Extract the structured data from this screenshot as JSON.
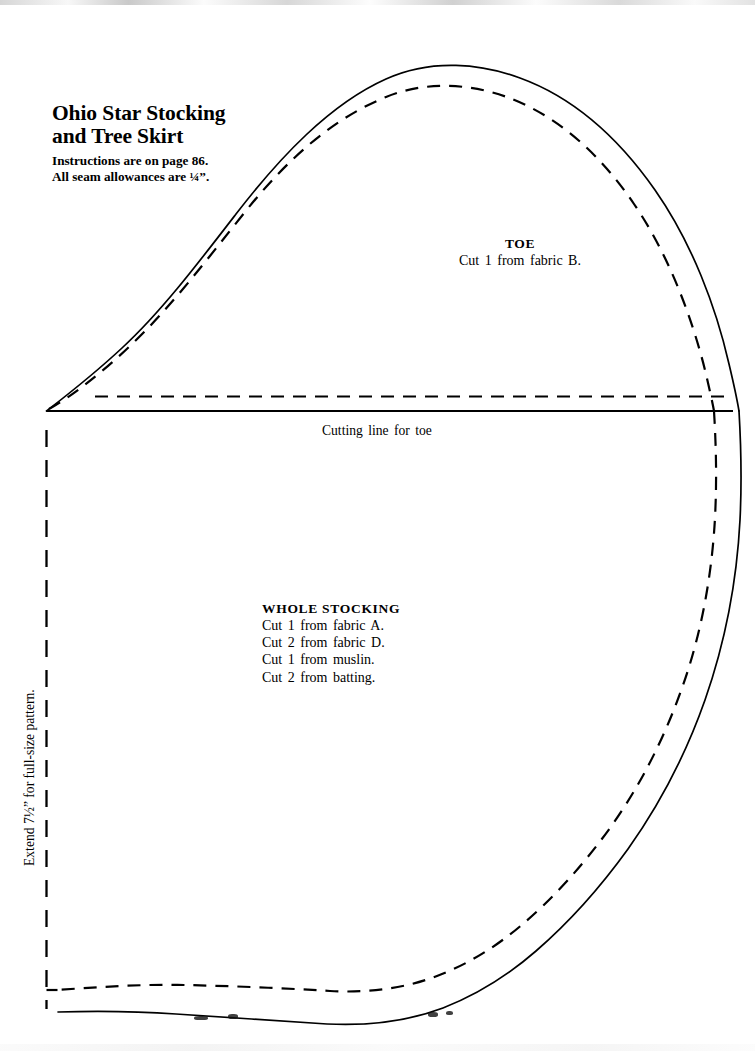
{
  "page": {
    "background_color": "#ffffff",
    "ink_color": "#000000",
    "width": 755,
    "height": 1051
  },
  "title": {
    "line1": "Ohio Star Stocking",
    "line2": "and Tree Skirt",
    "instructions": "Instructions are on page 86.",
    "seam_allowance": "All seam allowances are ¼”."
  },
  "toe": {
    "heading": "TOE",
    "cut_line": "Cut 1 from fabric B."
  },
  "cutting_line": {
    "label": "Cutting line for toe"
  },
  "whole_stocking": {
    "heading": "WHOLE STOCKING",
    "lines": [
      "Cut 1 from fabric A.",
      "Cut 2 from fabric D.",
      "Cut 1 from muslin.",
      "Cut 2 from batting."
    ]
  },
  "extend_note": {
    "label": "Extend 7½” for full-size pattern."
  },
  "linework": {
    "solid_stroke_width": 1.7,
    "dashed_stroke_width": 2.2,
    "dash_pattern": "13 9",
    "fold_dash_pattern": "17 13",
    "toe_outline_path": "M 46.5 411 C 62 399 92 376 122 348 C 160 313 196 266 236 214 C 280 157 330 104 386 79 C 432 58 482 64 520 78 C 575 98 620 140 655 190 C 692 243 716 307 729 364 C 734 385 737 399 739 411",
    "toe_seam_path": "M 49 409 C 72 396 103 372 131 345 C 170 308 205 262 245 212 C 288 158 334 118 386 97 C 430 79 477 85 512 99 C 562 119 602 157 634 204 C 667 252 691 314 705 370 C 709 387 712 400 714 411",
    "body_right_solid_path": "M 739 411 C 741 445 742 480 740 520 C 737 578 726 640 705 700 C 686 754 660 804 628 849 C 597 892 566 925 536 951 C 505 978 474 996 443 1008 C 406 1022 367 1026 327 1024 C 278 1021 225 1017 176 1014 C 133 1011 92 1011 58 1012",
    "body_right_seam_path": "M 714 411 C 716 444 717 479 715 518 C 712 573 702 632 682 688 C 664 739 640 786 610 828 C 581 868 552 899 524 923 C 495 948 466 965 437 976 C 403 989 367 993 330 991 C 282 988 231 986 184 985 C 142 984 100 987 57 990",
    "cutting_line_solid": {
      "x1": 46.5,
      "y1": 411,
      "x2": 733,
      "y2": 411
    },
    "toe_bottom_dashed": {
      "x1": 95,
      "y1": 396.5,
      "x2": 726,
      "y2": 396.5
    },
    "fold_line_dashed": {
      "x1": 46.5,
      "y1": 430,
      "x2": 46.5,
      "y2": 1009
    },
    "bottom_tick_dashed": {
      "x1": 46.5,
      "y1": 990,
      "x2": 58,
      "y2": 990
    }
  }
}
